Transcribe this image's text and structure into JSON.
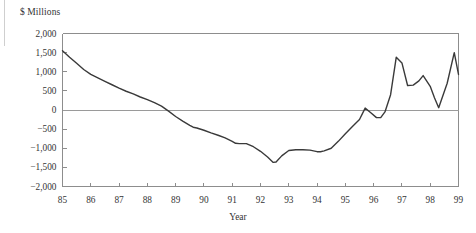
{
  "figure": {
    "y_axis_title": "$ Millions",
    "x_axis_title": "Year"
  },
  "chart_data": {
    "type": "line",
    "title": "",
    "subtitle": "",
    "xlabel": "Year",
    "ylabel": "$ Millions",
    "xlim": [
      85,
      99
    ],
    "ylim": [
      -2000,
      2000
    ],
    "grid": false,
    "legend": null,
    "zero_line": 0,
    "y_ticks": [
      2000,
      1500,
      1000,
      500,
      0,
      -500,
      -1000,
      -1500,
      -2000
    ],
    "y_tick_labels": [
      "2,000",
      "1,500",
      "1,000",
      "500",
      "0",
      "−500",
      "−1,000",
      "−1,500",
      "−2,000"
    ],
    "x_ticks": [
      85,
      86,
      87,
      88,
      89,
      90,
      91,
      92,
      93,
      94,
      95,
      96,
      97,
      98,
      99
    ],
    "x_tick_labels": [
      "85",
      "86",
      "87",
      "88",
      "89",
      "90",
      "91",
      "92",
      "93",
      "94",
      "95",
      "96",
      "97",
      "98",
      "99"
    ],
    "series": [
      {
        "name": "Balance",
        "color": "#3a3a3a",
        "x": [
          85.0,
          85.25,
          85.5,
          85.75,
          86.0,
          86.25,
          86.5,
          86.75,
          87.0,
          87.25,
          87.5,
          87.75,
          88.0,
          88.25,
          88.5,
          88.75,
          89.0,
          89.25,
          89.5,
          89.62,
          89.75,
          90.0,
          90.25,
          90.5,
          90.75,
          91.0,
          91.12,
          91.25,
          91.5,
          91.75,
          92.0,
          92.25,
          92.45,
          92.55,
          92.75,
          93.0,
          93.25,
          93.5,
          93.75,
          94.0,
          94.12,
          94.25,
          94.5,
          94.75,
          95.0,
          95.25,
          95.5,
          95.7,
          95.9,
          96.1,
          96.25,
          96.4,
          96.6,
          96.8,
          97.0,
          97.2,
          97.4,
          97.6,
          97.75,
          98.0,
          98.15,
          98.3,
          98.6,
          98.85,
          99.0
        ],
        "y": [
          1550,
          1380,
          1220,
          1060,
          930,
          840,
          750,
          660,
          570,
          490,
          420,
          340,
          270,
          190,
          100,
          -30,
          -170,
          -290,
          -400,
          -450,
          -470,
          -530,
          -600,
          -660,
          -730,
          -820,
          -870,
          -880,
          -880,
          -960,
          -1080,
          -1230,
          -1370,
          -1360,
          -1200,
          -1060,
          -1040,
          -1040,
          -1050,
          -1090,
          -1090,
          -1070,
          -1000,
          -820,
          -620,
          -430,
          -250,
          50,
          -70,
          -200,
          -200,
          -50,
          400,
          1380,
          1230,
          640,
          650,
          760,
          900,
          620,
          320,
          60,
          700,
          1500,
          930
        ]
      }
    ]
  }
}
